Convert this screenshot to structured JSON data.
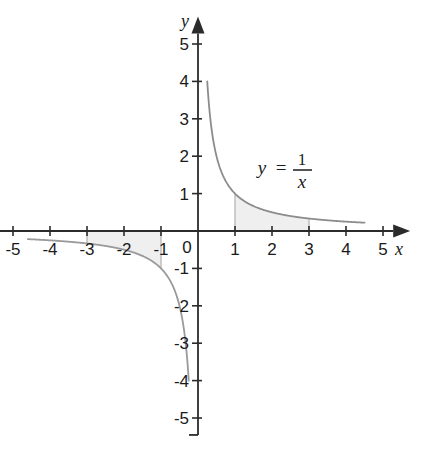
{
  "chart_data": {
    "type": "line",
    "title": "",
    "xlabel": "x",
    "ylabel": "y",
    "xlim": [
      -5.4,
      5.6
    ],
    "ylim": [
      -5.4,
      5.6
    ],
    "grid": false,
    "legend": null,
    "function": "y = 1/x",
    "annotation": {
      "text_y": "y",
      "text_equals": "=",
      "numerator": "1",
      "denominator": "x",
      "x": 2.0,
      "y": 1.85
    },
    "x_ticks": [
      -5,
      -4,
      -3,
      -2,
      -1,
      0,
      1,
      2,
      3,
      4,
      5
    ],
    "x_tick_labels": [
      "-5",
      "-4",
      "-3",
      "-2",
      "-1",
      "0",
      "1",
      "2",
      "3",
      "4",
      "5"
    ],
    "y_ticks": [
      -5,
      -4,
      -3,
      -2,
      -1,
      1,
      2,
      3,
      4,
      5
    ],
    "y_tick_labels": [
      "-5",
      "-4",
      "-3",
      "-2",
      "-1",
      "1",
      "2",
      "3",
      "4",
      "5"
    ],
    "series": [
      {
        "name": "y = 1/x (positive branch)",
        "x_start": 0.25,
        "x_end": 4.5,
        "color": "#8c8c8c"
      },
      {
        "name": "y = 1/x (negative branch)",
        "x_start": -4.6,
        "x_end": -0.25,
        "color": "#9a9a9a"
      }
    ],
    "shaded_regions": [
      {
        "name": "area-under-curve-positive",
        "x_from": 1,
        "x_to": 3,
        "fill": "#efefef",
        "edge": "#b0b0b0"
      },
      {
        "name": "area-above-curve-negative",
        "x_from": -3,
        "x_to": -1,
        "fill": "#efefef",
        "edge": "#b0b0b0"
      }
    ],
    "colors": {
      "axis": "#2b2b2b",
      "curve": "#8c8c8c",
      "fill": "#efefef",
      "text": "#1a1a1a",
      "background": "#ffffff"
    }
  }
}
